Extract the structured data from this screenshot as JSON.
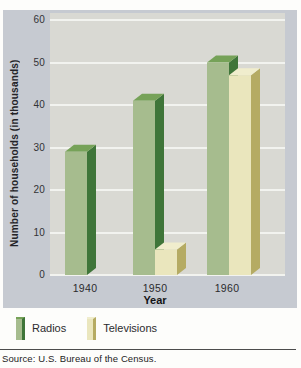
{
  "chart_data": {
    "type": "bar",
    "categories": [
      "1940",
      "1950",
      "1960"
    ],
    "series": [
      {
        "name": "Radios",
        "values": [
          29,
          41,
          50
        ],
        "front_color": "#a6bc8e",
        "side_color": "#3f7539",
        "top_color": "#76a258"
      },
      {
        "name": "Televisions",
        "values": [
          null,
          6,
          47
        ],
        "front_color": "#eae6bd",
        "side_color": "#b5ab63",
        "top_color": "#f0edcd"
      }
    ],
    "title": "",
    "xlabel": "Year",
    "ylabel": "Number of households (in thousands)",
    "ylim": [
      0,
      60
    ],
    "yticks": [
      0,
      10,
      20,
      30,
      40,
      50,
      60
    ],
    "grid": true,
    "legend_position": "bottom-left",
    "style": "3d-bars"
  },
  "legend": {
    "items": [
      {
        "label": "Radios"
      },
      {
        "label": "Televisions"
      }
    ]
  },
  "source_note": "Source: U.S. Bureau of the Census.",
  "colors": {
    "panel_background": "#c6cad1",
    "plot_background": "#d9d9d3",
    "gridline": "#f2f3ef",
    "rule": "#4c4c4c"
  }
}
